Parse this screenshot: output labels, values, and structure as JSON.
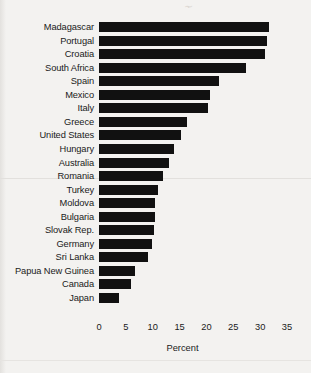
{
  "chart_data": {
    "type": "bar",
    "orientation": "horizontal",
    "title": "",
    "xlabel": "Percent",
    "ylabel": "",
    "xlim": [
      0,
      35
    ],
    "xticks": [
      0,
      5,
      10,
      15,
      20,
      25,
      30,
      35
    ],
    "grid": false,
    "legend": null,
    "bar_color": "#111111",
    "background_color": "#f3f2f0",
    "categories": [
      "Madagascar",
      "Portugal",
      "Croatia",
      "South Africa",
      "Spain",
      "Mexico",
      "Italy",
      "Greece",
      "United States",
      "Hungary",
      "Australia",
      "Romania",
      "Turkey",
      "Moldova",
      "Bulgaria",
      "Slovak Rep.",
      "Germany",
      "Sri Lanka",
      "Papua New Guinea",
      "Canada",
      "Japan"
    ],
    "values": [
      31.7,
      31.3,
      30.9,
      27.4,
      22.3,
      20.6,
      20.3,
      16.4,
      15.3,
      13.9,
      13.0,
      12.0,
      11.0,
      10.4,
      10.4,
      10.3,
      9.9,
      9.1,
      6.7,
      6.0,
      3.8
    ]
  },
  "axis": {
    "tick_labels": [
      "0",
      "5",
      "10",
      "15",
      "20",
      "25",
      "30",
      "35"
    ],
    "x_axis_title": "Percent"
  },
  "artifacts": {
    "scan_mark": "⸟"
  }
}
